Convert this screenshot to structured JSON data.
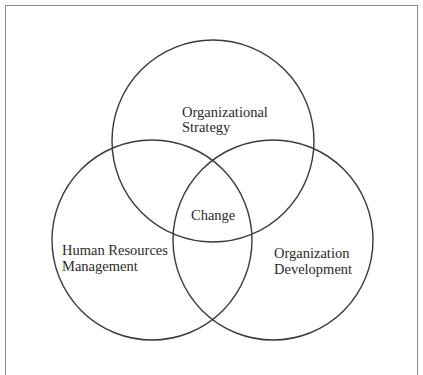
{
  "diagram": {
    "type": "venn",
    "colors": {
      "frame": "#8a8a8a",
      "stroke": "#3a3a3a",
      "text": "#2a2a2a",
      "background": "#ffffff"
    },
    "circles": [
      {
        "id": "organizational-strategy",
        "cx": 213,
        "cy": 141,
        "r": 101
      },
      {
        "id": "human-resources-management",
        "cx": 152,
        "cy": 240,
        "r": 100
      },
      {
        "id": "organization-development",
        "cx": 273,
        "cy": 240,
        "r": 100
      }
    ],
    "labels": {
      "organizational_strategy": {
        "line1": "Organizational",
        "line2": "Strategy"
      },
      "human_resources_management": {
        "line1": "Human Resources",
        "line2": "Management"
      },
      "organization_development": {
        "line1": "Organization",
        "line2": "Development"
      },
      "center": "Change"
    }
  }
}
